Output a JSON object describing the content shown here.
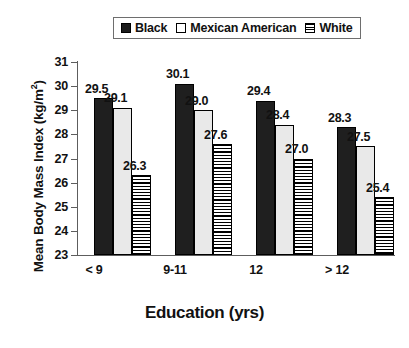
{
  "chart_data": {
    "type": "bar",
    "title": "",
    "xlabel": "Education (yrs)",
    "ylabel": "Mean Body Mass Index (kg/m2)",
    "ylabel_prefix": "Mean Body Mass Index (kg/m",
    "ylabel_sup": "2",
    "ylabel_suffix": ")",
    "categories": [
      "< 9",
      "9-11",
      "12",
      "> 12"
    ],
    "ylim": [
      23,
      31
    ],
    "yticks": [
      23,
      24,
      25,
      26,
      27,
      28,
      29,
      30,
      31
    ],
    "grid": false,
    "legend_position": "top",
    "series": [
      {
        "name": "Black",
        "fill": "solid-black",
        "color": "#1f1f1f",
        "values": [
          29.5,
          30.1,
          29.4,
          28.3
        ],
        "labels": [
          "29.5",
          "30.1",
          "29.4",
          "28.3"
        ]
      },
      {
        "name": "Mexican American",
        "fill": "open-white",
        "color": "#e9e9e9",
        "values": [
          29.1,
          29.0,
          28.4,
          27.5
        ],
        "labels": [
          "29.1",
          "29.0",
          "28.4",
          "27.5"
        ]
      },
      {
        "name": "White",
        "fill": "horizontal-stripes",
        "color": "#ffffff",
        "values": [
          26.3,
          27.6,
          27.0,
          25.4
        ],
        "labels": [
          "26.3",
          "27.6",
          "27.0",
          "25.4"
        ]
      }
    ]
  },
  "legend": {
    "items": [
      {
        "label": "Black"
      },
      {
        "label": "Mexican American"
      },
      {
        "label": "White"
      }
    ]
  },
  "yticks_text": [
    "31",
    "30",
    "29",
    "28",
    "27",
    "26",
    "25",
    "24",
    "23"
  ]
}
